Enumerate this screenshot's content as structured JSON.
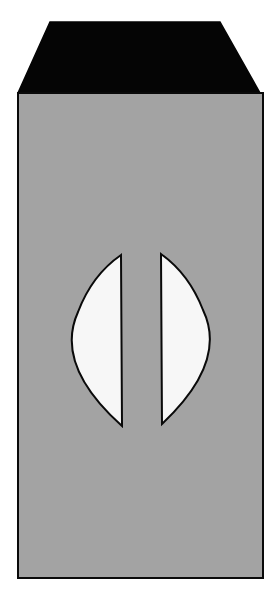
{
  "figure": {
    "colors": {
      "background": "#ffffff",
      "body": "#a3a3a3",
      "cap": "#050505",
      "opening": "#f7f7f7",
      "outline": "#0a0a0a"
    }
  }
}
